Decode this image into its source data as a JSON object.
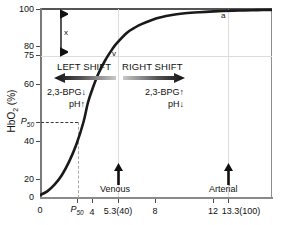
{
  "chart_data": {
    "type": "line",
    "title": "",
    "xlabel": "",
    "ylabel": "HbO2 (%)",
    "ylabel_main": "HbO",
    "ylabel_sub": "2",
    "ylabel_unit": " (%)",
    "xlim": [
      0,
      16
    ],
    "ylim": [
      0,
      100
    ],
    "grid": true,
    "legend": "none",
    "y_ticks": [
      {
        "value": 100,
        "label": "100"
      },
      {
        "value": 80,
        "label": "80"
      },
      {
        "value": 75,
        "label": "75"
      },
      {
        "value": 60,
        "label": "60"
      },
      {
        "value": 50,
        "label": "P50"
      },
      {
        "value": 40,
        "label": "40"
      },
      {
        "value": 20,
        "label": "20"
      },
      {
        "value": 0,
        "label": "0"
      }
    ],
    "x_ticks": [
      {
        "value": 0,
        "label": "0"
      },
      {
        "value": 3.3,
        "label": "P50"
      },
      {
        "value": 4,
        "label": "4"
      },
      {
        "value": 5.3,
        "label": "5.3(40)"
      },
      {
        "value": 8,
        "label": "8"
      },
      {
        "value": 12,
        "label": "12"
      },
      {
        "value": 13.3,
        "label": "13.3(100)"
      }
    ],
    "series": [
      {
        "name": "oxyhemoglobin dissociation curve",
        "color": "#1a1a1a",
        "x": [
          0,
          0.5,
          1.0,
          1.5,
          2.0,
          2.5,
          3.0,
          3.3,
          3.6,
          4.0,
          4.5,
          5.0,
          5.3,
          6.0,
          6.5,
          7.0,
          8.0,
          9.0,
          10.0,
          11.0,
          12.0,
          13.3,
          14.0,
          15.0,
          16.0
        ],
        "y": [
          1.5,
          3.5,
          7.0,
          12.0,
          19.0,
          28.0,
          40.0,
          50.0,
          57.0,
          65.0,
          72.5,
          78.5,
          81.5,
          87.0,
          89.5,
          91.5,
          94.5,
          96.2,
          97.2,
          97.8,
          98.2,
          98.6,
          98.7,
          98.9,
          99.0
        ]
      }
    ],
    "gridlines": {
      "horizontal": [
        75,
        100
      ],
      "vertical": [
        5.3,
        13.3
      ]
    },
    "point_markers": [
      {
        "label": "v",
        "x": 5.3,
        "y": 75,
        "name": "venous-point"
      },
      {
        "label": "a",
        "x": 13.3,
        "y": 97,
        "name": "arterial-point"
      }
    ],
    "annotations": {
      "span_arrow_label": "x",
      "left_shift_title": "LEFT SHIFT",
      "right_shift_title": "RIGHT SHIFT",
      "left_shift_line1": "2,3-BPG↓",
      "left_shift_line2": "pH↑",
      "right_shift_line1": "2,3-BPG↑",
      "right_shift_line2": "pH↓",
      "venous_marker": "Venous",
      "arterial_marker": "Arterial",
      "p50_y_label": "P50",
      "p50_x_label": "P50"
    }
  }
}
